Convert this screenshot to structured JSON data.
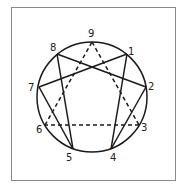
{
  "diagram": {
    "points": [
      {
        "id": "9",
        "label": "9"
      },
      {
        "id": "1",
        "label": "1"
      },
      {
        "id": "2",
        "label": "2"
      },
      {
        "id": "3",
        "label": "3"
      },
      {
        "id": "4",
        "label": "4"
      },
      {
        "id": "5",
        "label": "5"
      },
      {
        "id": "6",
        "label": "6"
      },
      {
        "id": "7",
        "label": "7"
      },
      {
        "id": "8",
        "label": "8"
      }
    ],
    "solid_edges": [
      [
        "1",
        "4"
      ],
      [
        "4",
        "2"
      ],
      [
        "2",
        "8"
      ],
      [
        "8",
        "5"
      ],
      [
        "5",
        "7"
      ],
      [
        "7",
        "1"
      ]
    ],
    "dashed_edges": [
      [
        "9",
        "3"
      ],
      [
        "3",
        "6"
      ],
      [
        "6",
        "9"
      ]
    ],
    "colors": {
      "line": "#1a1a1a",
      "frame": "#8a8a8a"
    }
  }
}
